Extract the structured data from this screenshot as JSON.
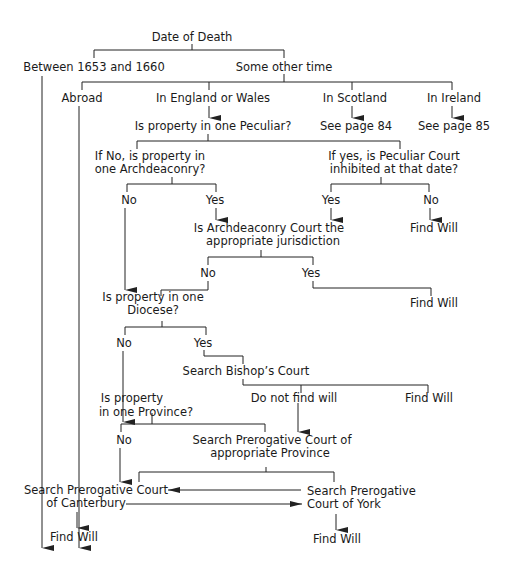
{
  "diagram": {
    "type": "flowchart",
    "root": "Date of Death",
    "nodes": {
      "date_of_death": "Date of Death",
      "between": "Between 1653 and 1660",
      "other_time": "Some other time",
      "abroad": "Abroad",
      "england_wales": "In England or Wales",
      "scotland": "In Scotland",
      "ireland": "In Ireland",
      "see_84": "See page 84",
      "see_85": "See page 85",
      "one_peculiar": "Is property in one Peculiar?",
      "archdeaconry_q_l1": "If No, is property in",
      "archdeaconry_q_l2": "one Archdeaconry?",
      "peculiar_inhib_l1": "If yes, is Peculiar Court",
      "peculiar_inhib_l2": "inhibited at that date?",
      "arch_no": "No",
      "arch_yes": "Yes",
      "inhib_yes": "Yes",
      "inhib_no": "No",
      "find_will_1": "Find Will",
      "arch_court_l1": "Is Archdeaconry Court the",
      "arch_court_l2": "appropriate jurisdiction",
      "court_no": "No",
      "court_yes": "Yes",
      "find_will_2": "Find Will",
      "diocese_l1": "Is property in one",
      "diocese_l2": "Diocese?",
      "dio_no": "No",
      "dio_yes": "Yes",
      "bishop": "Search Bishop’s Court",
      "not_find": "Do not find will",
      "find_will_3": "Find Will",
      "province_l1": "Is property",
      "province_l2": "in one Province?",
      "prov_no": "No",
      "prerog_l1": "Search Prerogative Court of",
      "prerog_l2": "appropriate Province",
      "canterbury_l1": "Search Prerogative Court",
      "canterbury_l2": "of Canterbury",
      "york_l1": "Search Prerogative",
      "york_l2": "Court of York",
      "find_will_4": "Find Will",
      "find_will_5": "Find Will"
    },
    "colors": {
      "line": "#222222",
      "text": "#1a1a1a",
      "background": "#ffffff"
    }
  }
}
